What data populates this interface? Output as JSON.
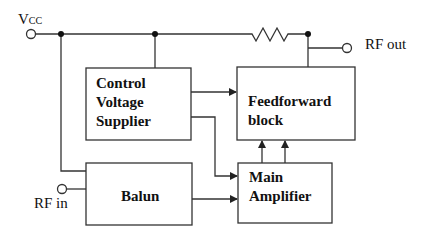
{
  "diagram": {
    "terminals": {
      "vcc": {
        "label": "V",
        "subscript": "CC"
      },
      "rf_out": {
        "label": "RF out"
      },
      "rf_in": {
        "label": "RF in"
      }
    },
    "blocks": {
      "control_voltage": {
        "lines": [
          "Control",
          "Voltage",
          "Supplier"
        ]
      },
      "feedforward": {
        "lines": [
          "Feedforward",
          "block"
        ]
      },
      "balun": {
        "lines": [
          "Balun"
        ]
      },
      "main_amplifier": {
        "lines": [
          "Main",
          "Amplifier"
        ]
      }
    },
    "connections": [
      {
        "from": "vcc",
        "to": "control_voltage",
        "type": "supply"
      },
      {
        "from": "vcc",
        "to": "balun",
        "type": "supply"
      },
      {
        "from": "vcc",
        "to": "rf_out",
        "type": "resistor"
      },
      {
        "from": "control_voltage",
        "to": "feedforward",
        "type": "arrow"
      },
      {
        "from": "control_voltage",
        "to": "main_amplifier",
        "type": "arrow"
      },
      {
        "from": "rf_in",
        "to": "balun",
        "type": "line"
      },
      {
        "from": "balun",
        "to": "main_amplifier",
        "type": "arrow"
      },
      {
        "from": "main_amplifier",
        "to": "feedforward",
        "type": "arrow",
        "count": 2
      },
      {
        "from": "feedforward",
        "to": "rf_out",
        "type": "line"
      }
    ],
    "colors": {
      "line": "#333333",
      "text": "#111111",
      "background": "#ffffff"
    }
  }
}
